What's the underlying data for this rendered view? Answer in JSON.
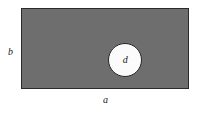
{
  "figure": {
    "name": "rectangular-plate-with-central-circular-hole",
    "background_color": "#ffffff",
    "plate": {
      "fill_color": "#6e6e6e",
      "border_color": "#2b2b2b"
    },
    "hole": {
      "fill_color": "#fbfbfb",
      "border_color": "#262626",
      "label": "d"
    },
    "dimensions": {
      "width_label": "a",
      "height_label": "b"
    }
  }
}
